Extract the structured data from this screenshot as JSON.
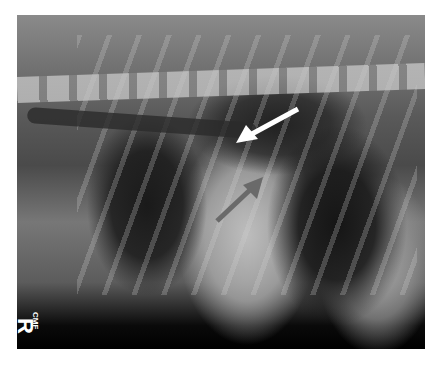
{
  "image": {
    "type": "lateral thoracic radiograph",
    "side_marker": "R",
    "marker_subtext": "CMF",
    "annotations": [
      {
        "name": "white-arrow",
        "color": "#ffffff",
        "direction": "down-left"
      },
      {
        "name": "gray-arrow",
        "color": "#6a6a6a",
        "direction": "up-right"
      }
    ]
  }
}
